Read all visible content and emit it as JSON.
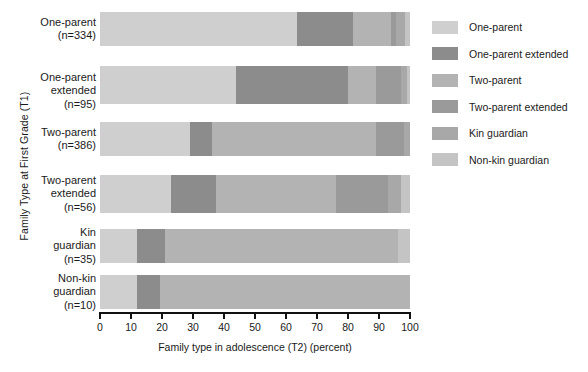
{
  "chart_data": {
    "type": "bar",
    "orientation": "horizontal",
    "stacked": true,
    "normalized_percent": true,
    "title": "",
    "xlabel": "Family type in adolescence (T2)  (percent)",
    "ylabel": "Family Type at First Grade (T1)",
    "xlim": [
      0,
      100
    ],
    "xticks": [
      0,
      10,
      20,
      30,
      40,
      50,
      60,
      70,
      80,
      90,
      100
    ],
    "xtick_labels": [
      "0",
      "10",
      "20",
      "30",
      "40",
      "50",
      "60",
      "70",
      "80",
      "90",
      "100"
    ],
    "grid": false,
    "legend_position": "right",
    "categories": [
      "One-parent\n(n=334)",
      "One-parent\nextended\n(n=95)",
      "Two-parent\n(n=386)",
      "Two-parent\nextended\n(n=56)",
      "Kin\nguardian\n(n=35)",
      "Non-kin\nguardian\n(n=10)"
    ],
    "category_names": [
      "One-parent",
      "One-parent extended",
      "Two-parent",
      "Two-parent extended",
      "Kin guardian",
      "Non-kin guardian"
    ],
    "category_counts": [
      334,
      95,
      386,
      56,
      35,
      10
    ],
    "series": [
      {
        "name": "One-parent",
        "color": "#cfcfcf",
        "values": [
          63.5,
          44.0,
          29.0,
          23.0,
          12.0,
          12.0
        ]
      },
      {
        "name": "One-parent extended",
        "color": "#8c8c8c",
        "values": [
          18.0,
          36.0,
          7.0,
          14.5,
          9.0,
          7.5
        ]
      },
      {
        "name": "Two-parent",
        "color": "#b3b3b3",
        "values": [
          12.5,
          9.0,
          53.0,
          38.5,
          75.0,
          80.5
        ]
      },
      {
        "name": "Two-parent extended",
        "color": "#9a9a9a",
        "values": [
          1.5,
          8.0,
          9.0,
          17.0,
          0.0,
          0.0
        ]
      },
      {
        "name": "Kin guardian",
        "color": "#a8a8a8",
        "values": [
          3.0,
          2.0,
          2.0,
          4.0,
          0.0,
          0.0
        ]
      },
      {
        "name": "Non-kin guardian",
        "color": "#c4c4c4",
        "values": [
          1.5,
          1.0,
          0.0,
          3.0,
          4.0,
          0.0
        ]
      }
    ]
  },
  "legend": {
    "items": [
      {
        "label": "One-parent",
        "color": "#cfcfcf"
      },
      {
        "label": " One-parent extended",
        "color": "#8c8c8c"
      },
      {
        "label": "Two-parent",
        "color": "#b3b3b3"
      },
      {
        "label": "Two-parent extended",
        "color": "#9a9a9a"
      },
      {
        "label": "Kin guardian",
        "color": "#a8a8a8"
      },
      {
        "label": "Non-kin guardian",
        "color": "#c4c4c4"
      }
    ]
  }
}
